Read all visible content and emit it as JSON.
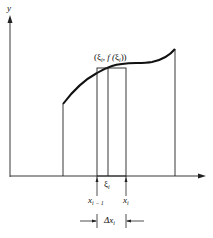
{
  "diagram": {
    "type": "riemann-sum-rectangle",
    "axes": {
      "y_label": "y",
      "x_label": ""
    },
    "point_label": {
      "open": "(",
      "xi": "ξ",
      "sub": "i",
      "sep": ", f (",
      "xi2": "ξ",
      "sub2": "i",
      "close": "))"
    },
    "xi_label": {
      "text": "ξ",
      "sub": "i"
    },
    "x_left_label": {
      "text": "x",
      "sub": "i − 1"
    },
    "x_right_label": {
      "text": "x",
      "sub": "i"
    },
    "delta_label": {
      "text": "Δx",
      "sub": "i"
    },
    "colors": {
      "line": "#111111",
      "background": "#ffffff"
    }
  }
}
